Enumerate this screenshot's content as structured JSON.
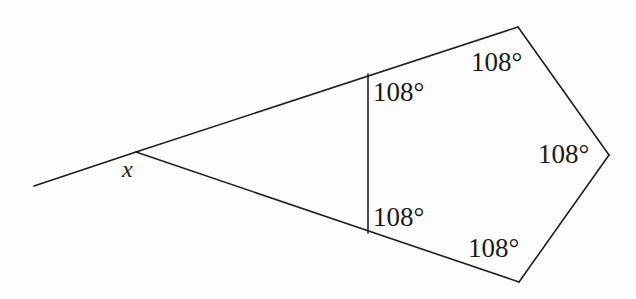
{
  "figure": {
    "type": "geometry-diagram",
    "background_color": "#fdfdfd",
    "stroke_color": "#1f1f1f",
    "stroke_width": 1.6,
    "labels": {
      "unknown_angle": "x",
      "angle_upper_middle": "108°",
      "angle_top_right": "108°",
      "angle_right": "108°",
      "angle_bottom_right": "108°",
      "angle_lower_middle": "108°"
    },
    "geometry": {
      "ray_start": [
        34,
        186
      ],
      "apex": [
        136,
        152
      ],
      "upper_arm_end": [
        518,
        27
      ],
      "lower_arm_end": [
        519,
        282
      ],
      "pentagon_right": [
        609,
        155
      ],
      "chord_top": [
        368,
        74
      ],
      "chord_bottom": [
        368,
        233
      ]
    }
  }
}
